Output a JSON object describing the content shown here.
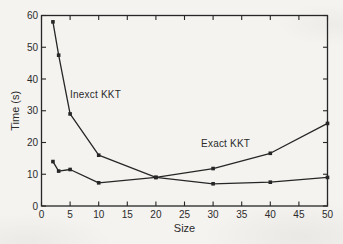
{
  "figure": {
    "kind": "scanned-plot",
    "background_color": "#f4f3f0",
    "line_color": "#262626",
    "text_color": "#2b2b2b",
    "marker_shape": "filled-square"
  },
  "chart_data": {
    "type": "line",
    "title": "",
    "xlabel": "Size",
    "ylabel": "Time (s)",
    "xlim": [
      0,
      50
    ],
    "ylim": [
      0,
      60
    ],
    "x_ticks": [
      0,
      5,
      10,
      15,
      20,
      25,
      30,
      35,
      40,
      45,
      50
    ],
    "y_ticks": [
      0,
      10,
      20,
      30,
      40,
      50,
      60
    ],
    "grid": false,
    "box": true,
    "legend_position": "inline-annotations",
    "series": [
      {
        "name": "Inexct KKT",
        "marker": "filled-square",
        "x": [
          2,
          3,
          5,
          10,
          20,
          30,
          40,
          50
        ],
        "y": [
          58,
          47.5,
          29,
          16,
          9,
          7,
          7.5,
          9
        ]
      },
      {
        "name": "Exact KKT",
        "marker": "filled-square",
        "x": [
          2,
          3,
          5,
          10,
          20,
          30,
          40,
          50
        ],
        "y": [
          14,
          11,
          11.5,
          7.3,
          9,
          11.8,
          16.6,
          26
        ]
      }
    ],
    "annotations": [
      {
        "text": "Inexct KKT",
        "x": 5.0,
        "y": 34.0
      },
      {
        "text": "Exact KKT",
        "x": 27.9,
        "y": 18.6
      }
    ]
  }
}
